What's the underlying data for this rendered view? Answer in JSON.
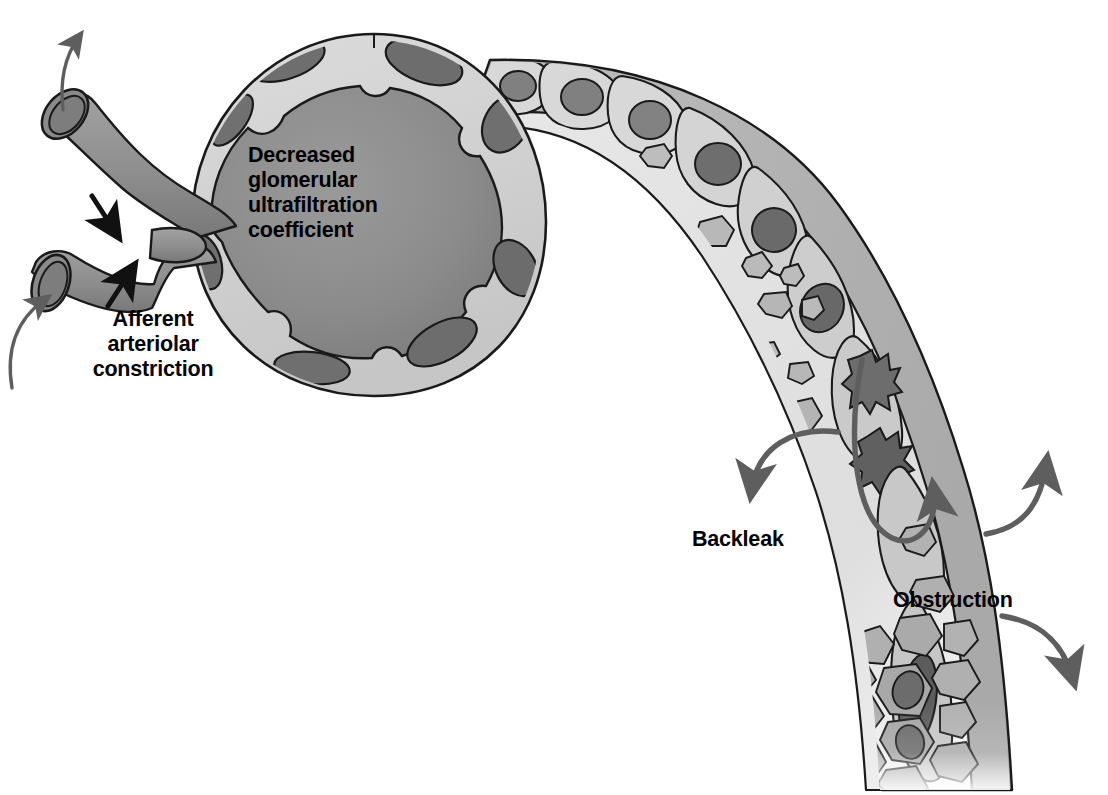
{
  "figure": {
    "title_text_present": false,
    "type": "medical-illustration",
    "background_color": "#ffffff"
  },
  "labels": {
    "glomerulus": {
      "name": "decreased-glomerular-ultrafiltration-coefficient",
      "line1": "Decreased",
      "line2": "glomerular",
      "line3": "ultrafiltration",
      "line4": "coefficient"
    },
    "afferent": {
      "name": "afferent-arteriolar-constriction",
      "line1": "Afferent",
      "line2": "arteriolar",
      "line3": "constriction"
    },
    "backleak": {
      "name": "backleak",
      "text": "Backleak"
    },
    "obstruction": {
      "name": "obstruction",
      "text": "Obstruction"
    }
  },
  "structures": {
    "glomerulus": "glomerular tuft enclosed by Bowman's capsule",
    "bowmans_capsule": "capsule with flattened epithelial cells and dark nuclei",
    "afferent_arteriole": "lower vessel entering the glomerulus, constricted",
    "efferent_arteriole": "upper vessel leaving the glomerulus",
    "proximal_tubule": "curved tubule descending to lower right",
    "tubular_epithelium": "cuboidal cells with rounded nuclei lining the tubule",
    "necrotic_cells": "two cells with jagged dark pyknotic nuclei in the tubule wall",
    "sloughed_debris": "irregular fragments shed into the tubular lumen",
    "cast": "dense plug of cellular debris obstructing the distal tubule lumen"
  },
  "arrows": {
    "efferent_flow": {
      "name": "efferent-flow-arrow",
      "direction": "up-left, outward"
    },
    "afferent_flow": {
      "name": "afferent-flow-arrow",
      "direction": "up-right, inward"
    },
    "constriction_upper": {
      "name": "constriction-arrow-upper",
      "direction": "down-right"
    },
    "constriction_lower": {
      "name": "constriction-arrow-lower",
      "direction": "up-right"
    },
    "backleak": {
      "name": "backleak-arrow",
      "direction": "curving out of lumen to lower-left"
    },
    "obstruction_upper": {
      "name": "obstruction-pressure-arrow-upper",
      "direction": "curving out to upper-right"
    },
    "obstruction_lower": {
      "name": "obstruction-pressure-arrow-lower",
      "direction": "curving out to lower-right"
    },
    "intraluminal_backflow": {
      "name": "intraluminal-backflow-arrow",
      "direction": "U-turn within lumen"
    }
  },
  "colors": {
    "outline": "#1a1a1a",
    "tuft_fill": "#8c8c8c",
    "capsule_fill": "#cfcfcf",
    "nucleus_fill": "#6e6e6e",
    "nucleus_dark": "#5a5a5a",
    "tubule_cytoplasm": "#b4b4b4",
    "tubule_lumen": "#e2e2e2",
    "debris_fill": "#a8a8a8",
    "vessel_fill": "#909090",
    "vessel_lumen": "#7e7e7e",
    "arrow_gray": "#5e5e5e",
    "arrow_black": "#111111",
    "label_text": "#000000"
  }
}
